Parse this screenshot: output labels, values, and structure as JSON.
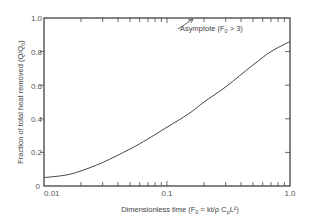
{
  "chart_data": {
    "type": "line",
    "title": "",
    "xlabel": "Dimensionless time (F",
    "xlabel_sub": "0",
    "xlabel_rest": " = kt/ρC",
    "xlabel_sub2": "p",
    "xlabel_end": "L²)",
    "ylabel": "Fraction of total heat removed (Q/Q",
    "ylabel_sub": "0",
    "ylabel_end": ")",
    "xscale": "log",
    "xlim": [
      0.01,
      1.0
    ],
    "ylim": [
      0,
      1.0
    ],
    "grid": false,
    "legend": null,
    "x_tick_labels": [
      "0.01",
      "0.1",
      "1.0"
    ],
    "y_tick_labels": [
      "0",
      "0.2",
      "0.4",
      "0.6",
      "0.8",
      "1.0"
    ],
    "y_ticks": [
      0,
      0.2,
      0.4,
      0.6,
      0.8,
      1.0
    ],
    "annotations": [
      {
        "text": "Asymptote (F",
        "sub": "0",
        "rest": " > 3)",
        "arrow_to": "top axis"
      }
    ],
    "series": [
      {
        "name": "Q/Q0",
        "x": [
          0.01,
          0.015,
          0.02,
          0.03,
          0.05,
          0.07,
          0.1,
          0.15,
          0.2,
          0.3,
          0.5,
          0.7,
          1.0
        ],
        "values": [
          0.05,
          0.065,
          0.09,
          0.14,
          0.22,
          0.28,
          0.35,
          0.43,
          0.5,
          0.59,
          0.72,
          0.8,
          0.86
        ]
      }
    ]
  },
  "labels": {
    "x_tick_0": "0.01",
    "x_tick_1": "0.1",
    "x_tick_2": "1.0",
    "y_tick_0": "0",
    "y_tick_1": "0.2",
    "y_tick_2": "0.4",
    "y_tick_3": "0.6",
    "y_tick_4": "0.8",
    "y_tick_5": "1.0",
    "xlabel_a": "Dimensionless time  (F",
    "xlabel_sub": "0",
    "xlabel_b": " =  kt/ρ C",
    "xlabel_sub2": "p",
    "xlabel_c": "L²)",
    "ylabel_a": "Fraction  of  total  heat  removed  (Q/Q",
    "ylabel_sub": "0",
    "ylabel_c": ")",
    "annot_a": "Asymptote  (F",
    "annot_sub": "0",
    "annot_c": " > 3)"
  },
  "colors": {
    "axis": "#333333",
    "curve": "#444444",
    "text": "#555555"
  }
}
